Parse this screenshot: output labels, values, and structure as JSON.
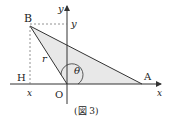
{
  "figure": {
    "caption": "(図 3)",
    "points": {
      "B": {
        "label": "B",
        "x": 30,
        "y": 26
      },
      "O": {
        "label": "O",
        "x": 67,
        "y": 84
      },
      "A": {
        "label": "A",
        "x": 142,
        "y": 84
      },
      "H": {
        "label": "H",
        "x": 30,
        "y": 84
      }
    },
    "axes": {
      "x_label": "x",
      "y_label": "y"
    },
    "labels": {
      "B": "B",
      "H": "H",
      "O": "O",
      "A": "A",
      "r": "r",
      "theta": "θ",
      "x_coord": "x",
      "y_coord": "y",
      "x_axis": "x",
      "y_axis": "y"
    },
    "colors": {
      "line": "#333333",
      "fill": "#e8e8e8",
      "dashed": "#777777"
    }
  }
}
